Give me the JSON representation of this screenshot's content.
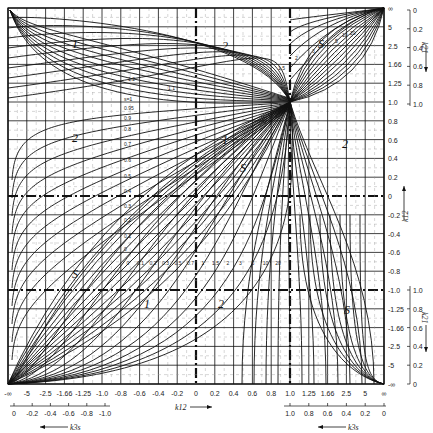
{
  "chart_data": {
    "type": "line",
    "title": "",
    "x_axis": {
      "label": "k12",
      "ticks": [
        "-∞",
        "-5",
        "-2.5",
        "-1.66",
        "-1.25",
        "-1.0",
        "-0.8",
        "-0.6",
        "-0.4",
        "-0.2",
        "0",
        "0.2",
        "0.4",
        "0.6",
        "0.8",
        "1.0",
        "1.25",
        "1.66",
        "2.5",
        "5",
        "∞"
      ]
    },
    "x_sub_axis_left": {
      "label": "k3s",
      "ticks": [
        "0",
        "-0.2",
        "-0.4",
        "-0.6",
        "-0.8",
        "-1.0"
      ]
    },
    "x_sub_axis_right": {
      "label": "k3s",
      "ticks": [
        "1.0",
        "0.8",
        "0.6",
        "0.4",
        "0.2",
        "0"
      ]
    },
    "y_axis_right": {
      "label": "k12",
      "ticks_top_to_bottom": [
        "∞",
        "5",
        "2.5",
        "1.66",
        "1.25",
        "1.0",
        "0.8",
        "0.6",
        "0.4",
        "0.2",
        "0",
        "-0.2",
        "-0.4",
        "-0.6",
        "-0.8",
        "-1.0",
        "-1.25",
        "-1.66",
        "-2.5",
        "-5",
        "-∞"
      ]
    },
    "y_sub_axis_top": {
      "label": "k21",
      "ticks": [
        "0",
        "0.2",
        "0.4",
        "0.6",
        "0.8",
        "1.0"
      ]
    },
    "y_sub_axis_bottom": {
      "label": "k21",
      "ticks": [
        "1.0",
        "0.8",
        "0.6",
        "0.4",
        "0.2",
        "0"
      ]
    },
    "regions": [
      "1",
      "2",
      "S"
    ],
    "curve_labels_left_family": [
      "s=1",
      "0.95",
      "0.9",
      "0.8",
      "0.7",
      "0.6",
      "0.5",
      "0.4",
      "0.3",
      "0.2",
      "0.1",
      "0"
    ],
    "curve_labels_top_family": [
      "1.1",
      "1.2",
      "1.5",
      "2",
      "3",
      "5",
      "10",
      "20"
    ],
    "curve_labels_bottom_family": [
      "0",
      "0.1",
      "0.2",
      "0.3",
      "0.5",
      "0.7",
      "1",
      "1.5",
      "2",
      "3",
      "5",
      "10",
      "20"
    ],
    "grid": true
  },
  "labels": {
    "x_axis_label": "k12",
    "x_sub_label": "k3s",
    "y_axis_label": "k12",
    "y_sub_label": "k21",
    "region_1": "1",
    "region_2": "2",
    "region_s": "S"
  }
}
